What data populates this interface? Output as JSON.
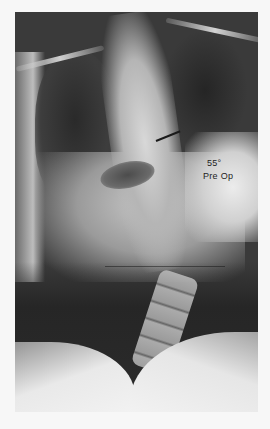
{
  "image": {
    "type": "radiograph",
    "subject": "frontal spine / chest-abdomen x-ray showing scoliosis curve",
    "annotations": {
      "angle": "55°",
      "stage": "Pre Op"
    },
    "colors": {
      "background": "#f7f7f7",
      "film_dark": "#262626",
      "film_bright": "#e6e6e6",
      "label_text": "#1d1d1d"
    }
  }
}
